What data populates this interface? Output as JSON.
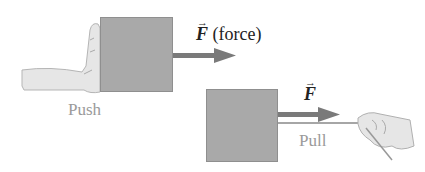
{
  "push_panel": {
    "label": "Push",
    "force_symbol": "F",
    "force_note": "(force)"
  },
  "pull_panel": {
    "label": "Pull",
    "force_symbol": "F"
  },
  "colors": {
    "box": "#a9a9a9",
    "arrow": "#7a7a7a",
    "label": "#9a9a9a",
    "text": "#222222"
  }
}
